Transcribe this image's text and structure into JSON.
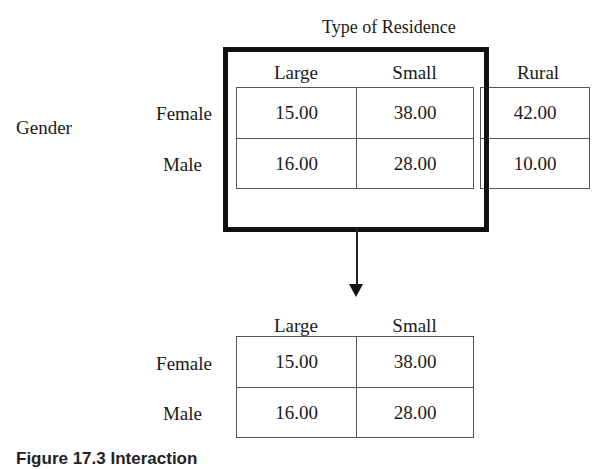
{
  "diagram": {
    "title": "Type of Residence",
    "factor_label": "Gender",
    "top_table": {
      "columns": [
        "Large",
        "Small",
        "Rural"
      ],
      "rows": [
        {
          "label": "Female",
          "values": [
            "15.00",
            "38.00",
            "42.00"
          ]
        },
        {
          "label": "Male",
          "values": [
            "16.00",
            "28.00",
            "10.00"
          ]
        }
      ],
      "highlighted_columns": [
        "Large",
        "Small"
      ]
    },
    "bottom_table": {
      "columns": [
        "Large",
        "Small"
      ],
      "rows": [
        {
          "label": "Female",
          "values": [
            "15.00",
            "38.00"
          ]
        },
        {
          "label": "Male",
          "values": [
            "16.00",
            "28.00"
          ]
        }
      ]
    },
    "caption": "Figure 17.3  Interaction"
  }
}
